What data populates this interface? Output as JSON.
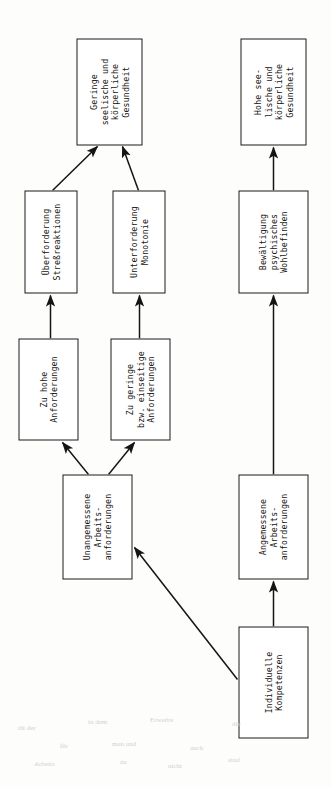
{
  "diagram": {
    "orientation": "rotated-90-ccw",
    "background_color": "#fdfdfc",
    "line_color": "#1a1a1a",
    "text_color": "#15130f",
    "nodes": [
      {
        "id": "geringe-gesundheit",
        "name": "geringe-gesundheit-node",
        "text": "Geringe\nseelische und\nkörperliche\nGesundheit",
        "x": 642,
        "y": 76,
        "w": 107,
        "h": 66
      },
      {
        "id": "ueberforderung",
        "name": "ueberforderung-node",
        "text": "Überforderung\nStreßreaktionen",
        "x": 494,
        "y": 24,
        "w": 103,
        "h": 53
      },
      {
        "id": "unterforderung",
        "name": "unterforderung-node",
        "text": "Unterforderung\nMonotonie",
        "x": 494,
        "y": 112,
        "w": 103,
        "h": 53
      },
      {
        "id": "zu-hohe",
        "name": "zu-hohe-anforderungen-node",
        "text": "Zu hohe\nAnforderungen",
        "x": 347,
        "y": 18,
        "w": 102,
        "h": 60
      },
      {
        "id": "zu-geringe",
        "name": "zu-geringe-anforderungen-node",
        "text": "Zu geringe\nbzw. einseitige\nAnforderungen",
        "x": 347,
        "y": 110,
        "w": 102,
        "h": 60
      },
      {
        "id": "unangemessene",
        "name": "unangemessene-arbeitsanforderungen-node",
        "text": "Unangemessene\nArbeits-\nanforderungen",
        "x": 208,
        "y": 62,
        "w": 105,
        "h": 70
      },
      {
        "id": "hohe-gesundheit",
        "name": "hohe-gesundheit-node",
        "text": "Hohe see-\nlische und\nkörperliche\nGesundheit",
        "x": 642,
        "y": 240,
        "w": 107,
        "h": 66
      },
      {
        "id": "bewaeltigung",
        "name": "bewaeltigung-node",
        "text": "Bewältigung\npsychisches\nWohlbefinden",
        "x": 494,
        "y": 238,
        "w": 103,
        "h": 70
      },
      {
        "id": "angemessene",
        "name": "angemessene-arbeitsanforderungen-node",
        "text": "Angemessene\nArbeits-\nanforderungen",
        "x": 208,
        "y": 238,
        "w": 105,
        "h": 70
      },
      {
        "id": "individuelle",
        "name": "individuelle-kompetenzen-node",
        "text": "Individuelle\nKompetenzen",
        "x": 49,
        "y": 238,
        "w": 112,
        "h": 70
      }
    ],
    "edges": [
      {
        "id": "e1",
        "name": "edge-ueberforderung-to-geringe-gesundheit",
        "from": "ueberforderung",
        "to": "geringe-gesundheit",
        "style": "diagonal"
      },
      {
        "id": "e2",
        "name": "edge-unterforderung-to-geringe-gesundheit",
        "from": "unterforderung",
        "to": "geringe-gesundheit",
        "style": "diagonal"
      },
      {
        "id": "e3",
        "name": "edge-zu-hohe-to-ueberforderung",
        "from": "zu-hohe",
        "to": "ueberforderung",
        "style": "straight"
      },
      {
        "id": "e4",
        "name": "edge-zu-geringe-to-unterforderung",
        "from": "zu-geringe",
        "to": "unterforderung",
        "style": "straight"
      },
      {
        "id": "e5",
        "name": "edge-unangemessene-to-zu-hohe",
        "from": "unangemessene",
        "to": "zu-hohe",
        "style": "diagonal"
      },
      {
        "id": "e6",
        "name": "edge-unangemessene-to-zu-geringe",
        "from": "unangemessene",
        "to": "zu-geringe",
        "style": "diagonal"
      },
      {
        "id": "e7",
        "name": "edge-bewaeltigung-to-hohe-gesundheit",
        "from": "bewaeltigung",
        "to": "hohe-gesundheit",
        "style": "straight"
      },
      {
        "id": "e8",
        "name": "edge-angemessene-to-bewaeltigung",
        "from": "angemessene",
        "to": "bewaeltigung",
        "style": "straight"
      },
      {
        "id": "e9",
        "name": "edge-individuelle-to-angemessene",
        "from": "individuelle",
        "to": "angemessene",
        "style": "straight"
      },
      {
        "id": "e10",
        "name": "edge-individuelle-to-unangemessene",
        "from": "individuelle",
        "to": "unangemessene",
        "style": "long-diagonal"
      }
    ],
    "bleed_marks": [
      {
        "text": "tät der",
        "x": 18,
        "y": 724
      },
      {
        "text": "in dem",
        "x": 88,
        "y": 718
      },
      {
        "text": "Erwerbs",
        "x": 150,
        "y": 716
      },
      {
        "text": "die",
        "x": 232,
        "y": 720
      },
      {
        "text": "für",
        "x": 60,
        "y": 742
      },
      {
        "text": "men und",
        "x": 112,
        "y": 740
      },
      {
        "text": "auch",
        "x": 190,
        "y": 744
      },
      {
        "text": "Arbeits",
        "x": 34,
        "y": 760
      },
      {
        "text": "zu",
        "x": 120,
        "y": 758
      },
      {
        "text": "nicht",
        "x": 168,
        "y": 762
      },
      {
        "text": "sind",
        "x": 228,
        "y": 756
      }
    ]
  }
}
